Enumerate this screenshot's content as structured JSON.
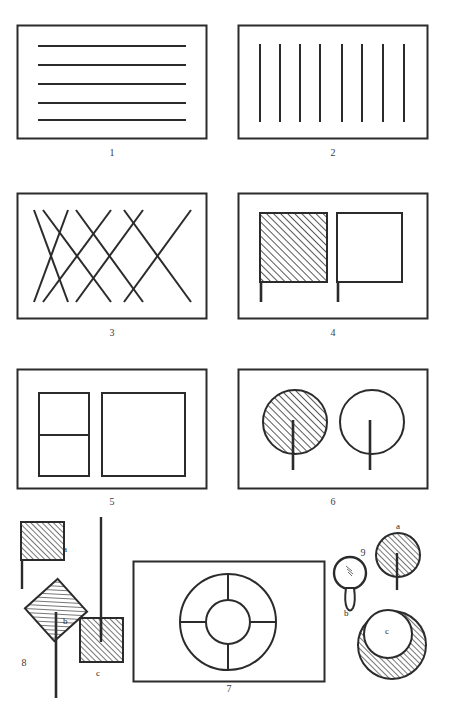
{
  "figure": {
    "title": "",
    "background_color": "#ffffff",
    "ink_color": "#2b2b2b",
    "hatch_color": "#3a3a3a"
  },
  "panels": [
    {
      "id": "panel-1",
      "caption": "1",
      "content_kind": "horizontal-lines-in-rectangle",
      "line_count": 5,
      "orientation": "horizontal"
    },
    {
      "id": "panel-2",
      "caption": "2",
      "content_kind": "vertical-lines-in-rectangle",
      "line_count": 8,
      "orientation": "vertical"
    },
    {
      "id": "panel-3",
      "caption": "3",
      "content_kind": "crossing-diagonal-lattice",
      "down_right_count": 4,
      "up_right_count": 4
    },
    {
      "id": "panel-4",
      "caption": "4",
      "content_kind": "two-squares-with-stems",
      "left_fill": "hatched",
      "right_fill": "outline"
    },
    {
      "id": "panel-5",
      "caption": "5",
      "content_kind": "two-rectangles",
      "left_fill": "outline-split-horizontally",
      "right_fill": "outline"
    },
    {
      "id": "panel-6",
      "caption": "6",
      "content_kind": "two-circles-with-stems",
      "left_fill": "hatched",
      "right_fill": "outline"
    },
    {
      "id": "panel-7",
      "caption": "7",
      "content_kind": "concentric-circles-with-four-spokes",
      "spoke_count": 4
    },
    {
      "id": "panel-8",
      "caption": "8",
      "content_kind": "loose-hatched-shapes-with-stems",
      "items": [
        {
          "label": "a",
          "shape": "square",
          "fill": "hatched",
          "stem": "short-bottom-left"
        },
        {
          "label": "b",
          "shape": "diamond",
          "fill": "hatched",
          "stem": "long-vertical"
        },
        {
          "label": "c",
          "shape": "square",
          "fill": "hatched",
          "stem": "long-vertical-upward"
        }
      ]
    },
    {
      "id": "panel-9",
      "caption": "9",
      "content_kind": "loose-hatched-circles",
      "items": [
        {
          "label": "a",
          "shape": "circle",
          "fill": "hatched",
          "stem": "vertical-downward"
        },
        {
          "label": "b",
          "shape": "circle",
          "fill": "outline",
          "stem": "short-handle"
        },
        {
          "label": "c",
          "shape": "annulus",
          "fill": "hatched-ring",
          "stem": "none"
        }
      ]
    }
  ]
}
